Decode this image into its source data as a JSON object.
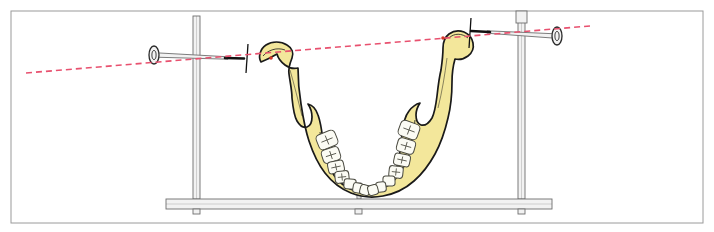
{
  "figure": {
    "domain_note": "anatomical line drawing, superior view of mandible",
    "canvas": {
      "width": 714,
      "height": 232,
      "background": "#ffffff"
    },
    "border_frame": {
      "name": "figure-border",
      "x": 11,
      "y": 11,
      "width": 692,
      "height": 212,
      "stroke": "#9a9a9a",
      "stroke_width": 1,
      "fill": "none"
    }
  },
  "colors": {
    "bone_fill": "#f3e79b",
    "bone_stroke": "#1a1a1a",
    "tooth_fill": "#fbfbf4",
    "tooth_stroke": "#4a4a40",
    "metal_fill": "#f2f2f2",
    "metal_stroke": "#6e6e6e",
    "metal_dark": "#111111",
    "reference_line": "#e8516f",
    "marker_dot": "#d4372a",
    "frame": "#9a9a9a"
  },
  "stand": {
    "name": "measurement-stand",
    "base_bar": {
      "name": "stand-base-bar",
      "x": 166,
      "y": 199,
      "width": 386,
      "height": 10,
      "label": "horizontal base rail"
    },
    "feet": [
      {
        "name": "stand-foot-left",
        "x": 193,
        "y": 209,
        "width": 7,
        "height": 5
      },
      {
        "name": "stand-foot-center",
        "x": 355,
        "y": 209,
        "width": 7,
        "height": 5
      },
      {
        "name": "stand-foot-right",
        "x": 518,
        "y": 209,
        "width": 7,
        "height": 5
      }
    ],
    "posts": [
      {
        "name": "vertical-post-left",
        "x": 193,
        "y_top": 16,
        "y_bottom": 199,
        "width": 7,
        "label": "left vertical post"
      },
      {
        "name": "vertical-post-right",
        "x": 518,
        "y_top": 12,
        "y_bottom": 199,
        "width": 7,
        "label": "right vertical post"
      }
    ],
    "post_collar": {
      "name": "post-collar-right",
      "x": 516,
      "y": 11,
      "width": 11,
      "height": 12,
      "label": "clamp block at top of right post"
    },
    "mandible_support": {
      "name": "mandible-support-rod",
      "x": 357,
      "y_top": 183,
      "y_bottom": 199,
      "width": 4,
      "label": "central support rod under symphysis"
    }
  },
  "pointers": [
    {
      "name": "pointer-left",
      "label": "left condylar pointer rod",
      "head": {
        "name": "pointer-head-left",
        "cx": 154,
        "cy": 55,
        "rx": 5,
        "ry": 9
      },
      "shaft": {
        "x1": 156,
        "y1": 55,
        "x2": 228,
        "y2": 58
      },
      "tip": {
        "name": "pointer-tip-left",
        "x1": 225,
        "y1": 58,
        "x2": 244,
        "y2": 58.5,
        "color": "#111111"
      }
    },
    {
      "name": "pointer-right",
      "label": "right condylar pointer rod",
      "head": {
        "name": "pointer-head-right",
        "cx": 557,
        "cy": 36,
        "rx": 5,
        "ry": 9
      },
      "shaft": {
        "x1": 555,
        "y1": 36,
        "x2": 487,
        "y2": 32
      },
      "tip": {
        "name": "pointer-tip-right",
        "x1": 490,
        "y1": 32,
        "x2": 471,
        "y2": 31,
        "color": "#111111"
      }
    }
  ],
  "tick_marks": [
    {
      "name": "scale-tick-left",
      "x1": 248,
      "y1": 44,
      "x2": 246,
      "y2": 73
    },
    {
      "name": "scale-tick-right",
      "x1": 471,
      "y1": 18,
      "x2": 469,
      "y2": 48
    }
  ],
  "reference_line": {
    "name": "intercondylar-reference-line",
    "label": "red dashed intercondylar axis",
    "x1": 26,
    "y1": 73,
    "x2": 590,
    "y2": 26,
    "stroke": "#e8516f",
    "dash": "6 4",
    "stroke_width": 1.6
  },
  "markers": [
    {
      "name": "condyle-marker-left",
      "cx": 271,
      "cy": 58,
      "r": 1.8
    },
    {
      "name": "condyle-marker-right",
      "cx": 443,
      "cy": 38,
      "r": 1.8
    }
  ],
  "mandible": {
    "name": "mandible-bone",
    "label": "mandible, superior view",
    "parts": {
      "left_condyle": "left condylar head",
      "right_condyle": "right condylar head",
      "left_coronoid": "left coronoid process",
      "right_coronoid": "right coronoid process",
      "left_ramus": "left ramus",
      "right_ramus": "right ramus",
      "body": "mandibular body and dental arch",
      "symphysis": "mental symphysis"
    },
    "outline_path": "M 261 62 C 258 57 260 49 266 45 C 272 41 281 41 287 45 C 292 48 294 53 292 58 C 290 63 288 68 289 74 C 290 82 292 90 292 98 C 293 108 294 116 297 121 C 300 126 304 128 307 127 C 310 126 312 122 312 117 C 312 112 310 107 308 104 C 312 105 316 109 318 115 C 321 123 322 132 323 141 C 324 152 327 162 331 170 C 335 178 341 184 348 188 C 354 191 361 192 368 191 C 375 190 381 187 386 183 C 392 178 396 171 398 163 C 400 154 401 144 402 134 C 403 124 405 116 409 111 C 412 107 416 104 420 103 C 418 106 416 110 416 115 C 416 120 418 124 421 125 C 425 126 429 123 432 118 C 435 112 436 104 437 96 C 438 87 439 78 441 70 C 442 63 443 55 443 48 C 443 42 445 37 449 34 C 453 31 459 30 464 32 C 469 34 472 38 473 43 C 474 48 472 53 468 56 C 464 59 459 60 455 59 C 453 66 452 74 452 82 C 452 94 451 106 448 118 C 445 131 441 143 435 154 C 429 165 422 174 414 181 C 405 189 394 194 383 196 C 372 198 361 197 351 193 C 341 189 332 182 325 173 C 318 164 313 153 309 141 C 305 129 303 117 301 104 C 299 92 298 80 298 68 C 294 69 289 68 285 65 C 281 62 278 58 277 54 C 272 57 266 60 261 62 Z",
    "teeth_left": [
      {
        "name": "tooth-left-1",
        "cx": 327,
        "cy": 140,
        "rx": 10,
        "ry": 8,
        "rot": -22
      },
      {
        "name": "tooth-left-2",
        "cx": 331,
        "cy": 155,
        "rx": 9,
        "ry": 7,
        "rot": -18
      },
      {
        "name": "tooth-left-3",
        "cx": 336,
        "cy": 167,
        "rx": 8,
        "ry": 6,
        "rot": -12
      },
      {
        "name": "tooth-left-4",
        "cx": 342,
        "cy": 177,
        "rx": 7,
        "ry": 6,
        "rot": -6
      },
      {
        "name": "tooth-left-5",
        "cx": 350,
        "cy": 184,
        "rx": 6,
        "ry": 5,
        "rot": 4
      },
      {
        "name": "tooth-left-6",
        "cx": 358,
        "cy": 188,
        "rx": 5,
        "ry": 5,
        "rot": 10
      },
      {
        "name": "tooth-left-7",
        "cx": 365,
        "cy": 190,
        "rx": 5,
        "ry": 5,
        "rot": 14
      }
    ],
    "teeth_right": [
      {
        "name": "tooth-right-1",
        "cx": 409,
        "cy": 130,
        "rx": 10,
        "ry": 8,
        "rot": 20
      },
      {
        "name": "tooth-right-2",
        "cx": 406,
        "cy": 146,
        "rx": 9,
        "ry": 7,
        "rot": 16
      },
      {
        "name": "tooth-right-3",
        "cx": 402,
        "cy": 160,
        "rx": 8,
        "ry": 6,
        "rot": 12
      },
      {
        "name": "tooth-right-4",
        "cx": 396,
        "cy": 172,
        "rx": 7,
        "ry": 6,
        "rot": 6
      },
      {
        "name": "tooth-right-5",
        "cx": 389,
        "cy": 181,
        "rx": 6,
        "ry": 5,
        "rot": -2
      },
      {
        "name": "tooth-right-6",
        "cx": 381,
        "cy": 187,
        "rx": 5,
        "ry": 5,
        "rot": -8
      },
      {
        "name": "tooth-right-7",
        "cx": 373,
        "cy": 190,
        "rx": 5,
        "ry": 5,
        "rot": -14
      }
    ]
  }
}
